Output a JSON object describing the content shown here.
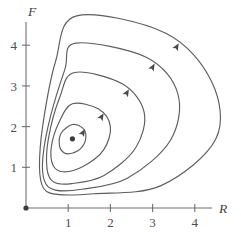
{
  "figure": {
    "kind": "phase-portrait",
    "background_color": "#ffffff",
    "curve_color": "#5d5d61",
    "axis_color": "#6f6f72",
    "marker_color": "#3b3b3f"
  },
  "axes": {
    "x_axis_label": "R",
    "y_axis_label": "F",
    "x_ticks": [
      "1",
      "2",
      "3",
      "4"
    ],
    "y_ticks": [
      "1",
      "2",
      "3",
      "4"
    ],
    "x_tick_values": [
      1,
      2,
      3,
      4
    ],
    "y_tick_values": [
      1,
      2,
      3,
      4
    ],
    "xlim": [
      0,
      5.1
    ],
    "ylim": [
      0,
      5.3
    ],
    "grid": false
  },
  "chart_data": {
    "type": "line",
    "title": "",
    "subtitle": "",
    "xlabel": "R",
    "ylabel": "F",
    "xlim": [
      0,
      5.1
    ],
    "ylim": [
      0,
      5.3
    ],
    "grid": false,
    "legend": "none",
    "categories": [],
    "annotations": [
      {
        "name": "equilibrium-point",
        "label": "",
        "x": 1.1,
        "y": 1.7,
        "marker": "dot"
      },
      {
        "name": "origin-point",
        "label": "",
        "x": 0.0,
        "y": 0.0,
        "marker": "dot"
      }
    ],
    "flow_direction": "counterclockwise",
    "series": [
      {
        "name": "orbit-1-innermost",
        "x": [
          1.1,
          1.34,
          1.42,
          1.33,
          1.11,
          0.9,
          0.79,
          0.84,
          1.1
        ],
        "y": [
          2.05,
          1.97,
          1.77,
          1.5,
          1.35,
          1.36,
          1.55,
          1.85,
          2.05
        ],
        "arrow_at": {
          "x": 1.4,
          "y": 1.94,
          "angle_deg": 300
        }
      },
      {
        "name": "orbit-2",
        "x": [
          1.1,
          1.72,
          2.0,
          1.84,
          1.35,
          0.88,
          0.64,
          0.6,
          0.78,
          1.1
        ],
        "y": [
          2.56,
          2.43,
          2.0,
          1.43,
          1.02,
          0.89,
          1.05,
          1.5,
          2.1,
          2.56
        ],
        "arrow_at": {
          "x": 1.84,
          "y": 2.33,
          "angle_deg": 300
        }
      },
      {
        "name": "orbit-3",
        "x": [
          1.15,
          2.28,
          2.8,
          2.6,
          1.85,
          1.08,
          0.66,
          0.5,
          0.53,
          0.8,
          1.15
        ],
        "y": [
          3.33,
          3.05,
          2.35,
          1.48,
          0.8,
          0.6,
          0.64,
          0.95,
          1.7,
          2.72,
          3.33
        ],
        "arrow_at": {
          "x": 2.44,
          "y": 2.92,
          "angle_deg": 300
        }
      },
      {
        "name": "orbit-4",
        "x": [
          1.18,
          2.86,
          3.6,
          3.42,
          2.4,
          1.32,
          0.7,
          0.44,
          0.4,
          0.58,
          0.92,
          1.18
        ],
        "y": [
          4.05,
          3.7,
          2.8,
          1.66,
          0.73,
          0.46,
          0.44,
          0.66,
          1.25,
          2.25,
          3.4,
          4.05
        ],
        "arrow_at": {
          "x": 3.05,
          "y": 3.55,
          "angle_deg": 300
        }
      },
      {
        "name": "orbit-5-outermost",
        "x": [
          1.2,
          3.3,
          4.4,
          4.5,
          3.2,
          1.6,
          0.78,
          0.42,
          0.32,
          0.4,
          0.7,
          1.2
        ],
        "y": [
          4.72,
          4.3,
          3.1,
          1.7,
          0.55,
          0.35,
          0.33,
          0.48,
          1.0,
          2.05,
          3.6,
          4.72
        ],
        "arrow_at": {
          "x": 3.62,
          "y": 4.05,
          "angle_deg": 300
        }
      }
    ]
  }
}
